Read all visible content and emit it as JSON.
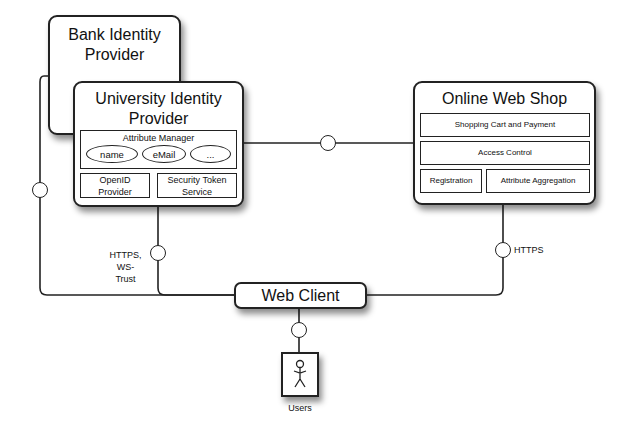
{
  "diagram": {
    "nodes": {
      "bank_idp": {
        "title_line1": "Bank Identity",
        "title_line2": "Provider"
      },
      "university_idp": {
        "title_line1": "University Identity",
        "title_line2": "Provider",
        "attribute_manager": {
          "label": "Attribute Manager",
          "attributes": [
            "name",
            "eMail",
            "..."
          ]
        },
        "openid": {
          "line1": "OpenID",
          "line2": "Provider"
        },
        "sts": {
          "line1": "Security Token",
          "line2": "Service"
        }
      },
      "web_shop": {
        "title": "Online Web Shop",
        "components": [
          "Shopping Cart and Payment",
          "Access Control",
          "Registration",
          "Attribute Aggregation"
        ]
      },
      "web_client": {
        "title": "Web Client"
      },
      "users": {
        "label": "Users"
      }
    },
    "edge_labels": {
      "idp_to_client_line1": "HTTPS,",
      "idp_to_client_line2": "WS-",
      "idp_to_client_line3": "Trust",
      "shop_to_client": "HTTPS"
    }
  }
}
